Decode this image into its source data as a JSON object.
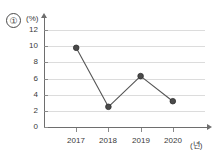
{
  "figure": {
    "item_marker": "①",
    "y_unit_label": "(%)",
    "x_unit_label": "(년)"
  },
  "chart_data": {
    "type": "line",
    "title": "",
    "subtitle": "",
    "xlabel": "(년)",
    "ylabel": "(%)",
    "categories": [
      "2017",
      "2018",
      "2019",
      "2020"
    ],
    "values": [
      9.8,
      2.5,
      6.3,
      3.2
    ],
    "series": [
      {
        "name": "①",
        "values": [
          9.8,
          2.5,
          6.3,
          3.2
        ]
      }
    ],
    "ylim": [
      0,
      13
    ],
    "yticks": [
      0,
      2,
      4,
      6,
      8,
      10,
      12
    ],
    "ytick_labels": [
      "0",
      "2",
      "4",
      "6",
      "8",
      "10",
      "12"
    ],
    "xtick_labels": [
      "2017",
      "2018",
      "2019",
      "2020"
    ],
    "grid": true,
    "grid_axis": "y",
    "legend": false,
    "legend_position": "none",
    "line_color": "#555555",
    "marker_color": "#4a4a4a",
    "marker_shape": "circle",
    "grid_color": "#dcdcdc",
    "axis_color": "#6e6e6e",
    "text_color": "#3a3a3a",
    "background_color": "#ffffff"
  }
}
